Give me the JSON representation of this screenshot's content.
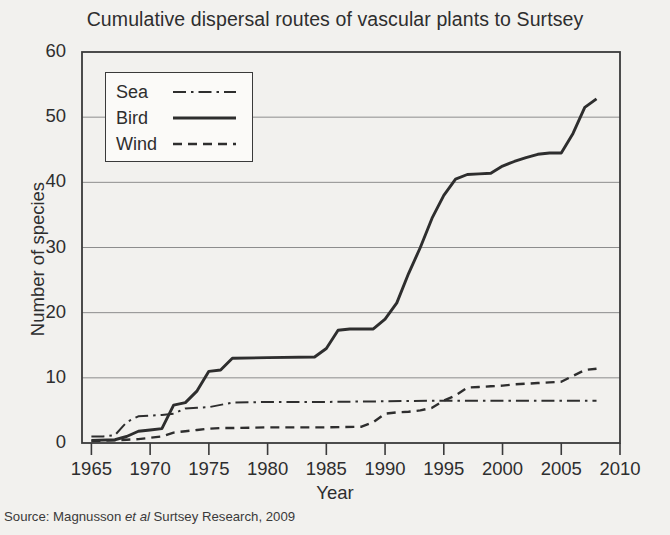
{
  "title": "Cumulative dispersal routes of vascular plants to Surtsey",
  "source": {
    "prefix": "Source: Magnusson ",
    "italic": "et al",
    "suffix": " Surtsey Research, 2009"
  },
  "axes": {
    "xlabel": "Year",
    "ylabel": "Number of species",
    "xticks": [
      "1965",
      "1970",
      "1975",
      "1980",
      "1985",
      "1990",
      "1995",
      "2000",
      "2005",
      "2010"
    ],
    "yticks": [
      "60",
      "50",
      "40",
      "30",
      "20",
      "10",
      "0"
    ]
  },
  "legend": {
    "items": [
      {
        "label": "Sea",
        "style": "dash-dot"
      },
      {
        "label": "Bird",
        "style": "solid"
      },
      {
        "label": "Wind",
        "style": "dashed"
      }
    ]
  },
  "colors": {
    "ink": "#2e2e2e",
    "grid": "#8d8d8d",
    "background": "#f2f1ee",
    "plot_background": "#fbfaf8"
  },
  "chart_data": {
    "type": "line",
    "title": "Cumulative dispersal routes of vascular plants to Surtsey",
    "xlabel": "Year",
    "ylabel": "Number of species",
    "xlim": [
      1964.2,
      2010
    ],
    "ylim": [
      0,
      60
    ],
    "xticks": [
      1965,
      1970,
      1975,
      1980,
      1985,
      1990,
      1995,
      2000,
      2005,
      2010
    ],
    "yticks": [
      0,
      10,
      20,
      30,
      40,
      50,
      60
    ],
    "grid": "horizontal",
    "legend_position": "upper-left-inside",
    "series": [
      {
        "name": "Sea",
        "style": "dash-dot",
        "x": [
          1965,
          1966,
          1967,
          1968,
          1969,
          1970,
          1971,
          1972,
          1973,
          1974,
          1975,
          1977,
          1980,
          1985,
          1990,
          1995,
          2000,
          2005,
          2008
        ],
        "values": [
          1,
          1,
          1.2,
          3.2,
          4.1,
          4.2,
          4.3,
          4.5,
          5.3,
          5.4,
          5.5,
          6.2,
          6.3,
          6.3,
          6.4,
          6.5,
          6.5,
          6.5,
          6.5
        ]
      },
      {
        "name": "Bird",
        "style": "solid",
        "x": [
          1965,
          1967,
          1968,
          1969,
          1970,
          1971,
          1972,
          1973,
          1974,
          1975,
          1976,
          1977,
          1980,
          1984,
          1985,
          1986,
          1987,
          1988,
          1989,
          1990,
          1991,
          1992,
          1993,
          1994,
          1995,
          1996,
          1997,
          1998,
          1999,
          2000,
          2001,
          2002,
          2003,
          2004,
          2005,
          2006,
          2007,
          2008
        ],
        "values": [
          0.4,
          0.5,
          1.0,
          1.8,
          2.0,
          2.2,
          5.8,
          6.2,
          8.0,
          11.0,
          11.2,
          13.0,
          13.1,
          13.2,
          14.5,
          17.3,
          17.5,
          17.5,
          17.5,
          19.0,
          21.5,
          26.0,
          30.0,
          34.5,
          38.0,
          40.5,
          41.2,
          41.3,
          41.4,
          42.5,
          43.2,
          43.8,
          44.3,
          44.5,
          44.5,
          47.5,
          51.5,
          52.8
        ]
      },
      {
        "name": "Wind",
        "style": "dashed",
        "x": [
          1965,
          1967,
          1968,
          1969,
          1970,
          1971,
          1972,
          1973,
          1974,
          1975,
          1976,
          1977,
          1980,
          1985,
          1988,
          1989,
          1990,
          1991,
          1992,
          1993,
          1994,
          1995,
          1996,
          1997,
          1998,
          1999,
          2000,
          2001,
          2002,
          2003,
          2004,
          2005,
          2006,
          2007,
          2008
        ],
        "values": [
          0.3,
          0.4,
          0.5,
          0.6,
          0.8,
          1.0,
          1.6,
          1.8,
          2.0,
          2.2,
          2.3,
          2.3,
          2.4,
          2.4,
          2.5,
          3.2,
          4.5,
          4.7,
          4.8,
          5.0,
          5.4,
          6.5,
          7.3,
          8.5,
          8.6,
          8.7,
          8.8,
          9.0,
          9.1,
          9.2,
          9.3,
          9.4,
          10.3,
          11.2,
          11.4
        ]
      }
    ]
  }
}
